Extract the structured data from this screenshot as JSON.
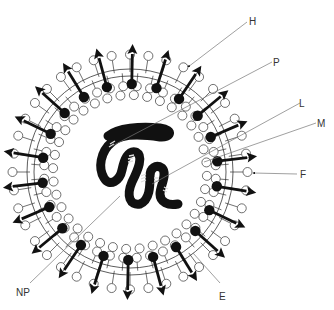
{
  "diagram": {
    "title": "",
    "labels": [
      {
        "id": "H",
        "text": "H"
      },
      {
        "id": "P",
        "text": "P"
      },
      {
        "id": "L",
        "text": "L"
      },
      {
        "id": "M",
        "text": "M"
      },
      {
        "id": "F",
        "text": "F"
      },
      {
        "id": "E",
        "text": "E"
      },
      {
        "id": "NP",
        "text": "NP"
      }
    ],
    "components": {
      "envelope": "lipid-bilayer",
      "spikes": "glycoprotein-arrows",
      "matrix": "inner-circle-layer",
      "nucleocapsid": "coiled-ribbon"
    }
  }
}
